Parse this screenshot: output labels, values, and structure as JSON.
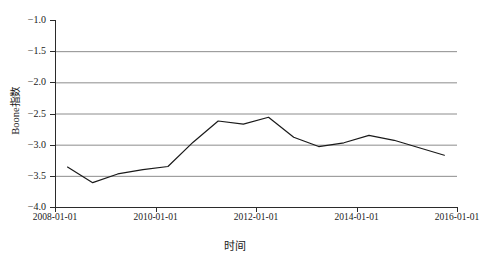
{
  "chart_data": {
    "type": "line",
    "title": "",
    "xlabel": "时间",
    "ylabel": "Boone指数",
    "ylim": [
      -4.0,
      -1.0
    ],
    "yticks": [
      -1.0,
      -1.5,
      -2.0,
      -2.5,
      -3.0,
      -3.5,
      -4.0
    ],
    "ytick_labels": [
      "−1.0",
      "−1.5",
      "−2.0",
      "−2.5",
      "−3.0",
      "−3.5",
      "−4.0"
    ],
    "xticks": [
      "2008-01-01",
      "2010-01-01",
      "2012-01-01",
      "2014-01-01",
      "2016-01-01"
    ],
    "xlim": [
      "2008-01-01",
      "2016-01-01"
    ],
    "grid": "horizontal",
    "legend": "none",
    "line_color": "#1a1a1a",
    "grid_color": "#8c8c8c",
    "series": [
      {
        "name": "Boone指数",
        "x": [
          "2008-04-01",
          "2008-10-01",
          "2009-04-01",
          "2009-10-01",
          "2010-04-01",
          "2010-10-01",
          "2011-04-01",
          "2011-10-01",
          "2012-04-01",
          "2012-10-01",
          "2013-04-01",
          "2013-10-01",
          "2014-04-01",
          "2014-10-01",
          "2015-04-01",
          "2015-10-01"
        ],
        "values": [
          -3.36,
          -3.61,
          -3.47,
          -3.4,
          -3.35,
          -2.96,
          -2.62,
          -2.67,
          -2.56,
          -2.88,
          -3.03,
          -2.97,
          -2.85,
          -2.93,
          -3.05,
          -3.17
        ]
      }
    ]
  }
}
